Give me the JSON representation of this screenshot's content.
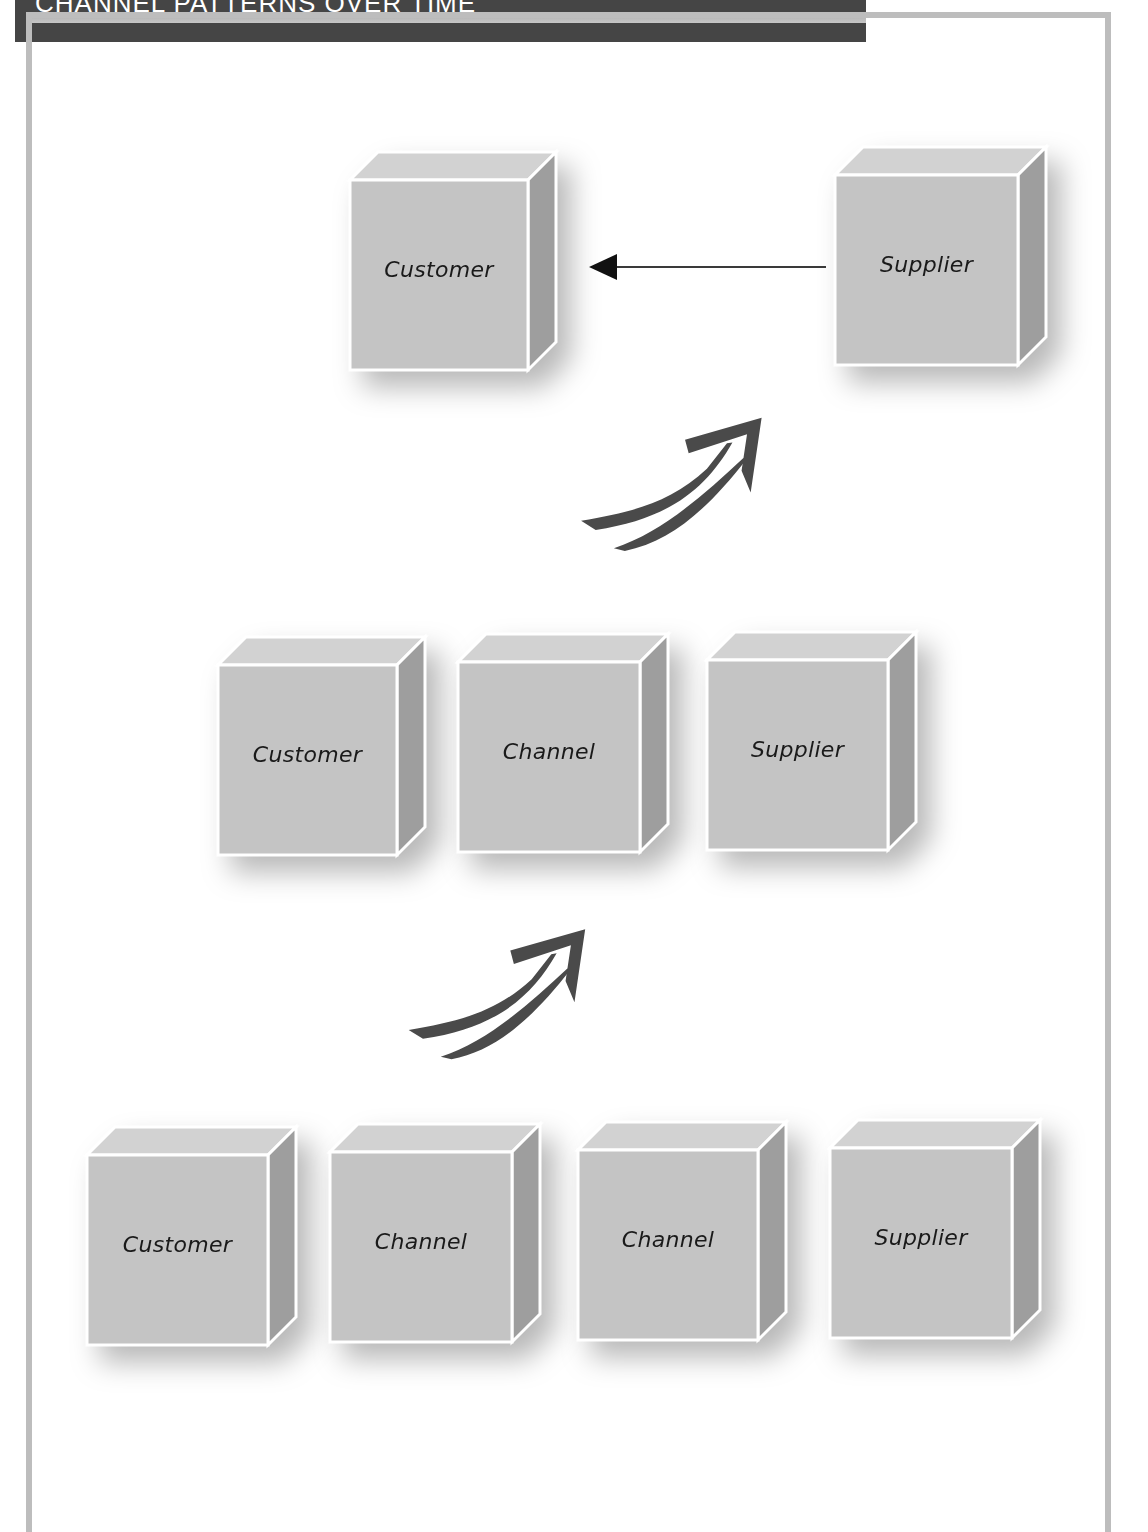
{
  "header": {
    "title": "CHANNEL PATTERNS OVER TIME"
  },
  "diagram": {
    "stages": [
      {
        "name": "direct",
        "nodes": [
          {
            "label": "Customer",
            "x": 350,
            "y": 180,
            "w": 178,
            "h": 190
          },
          {
            "label": "Supplier",
            "x": 835,
            "y": 175,
            "w": 183,
            "h": 190
          }
        ],
        "connector": {
          "type": "arrow-left",
          "from": "Supplier",
          "to": "Customer"
        }
      },
      {
        "name": "one-channel",
        "nodes": [
          {
            "label": "Customer",
            "x": 218,
            "y": 665,
            "w": 179,
            "h": 190
          },
          {
            "label": "Channel",
            "x": 458,
            "y": 662,
            "w": 182,
            "h": 190
          },
          {
            "label": "Supplier",
            "x": 707,
            "y": 660,
            "w": 181,
            "h": 190
          }
        ]
      },
      {
        "name": "two-channels",
        "nodes": [
          {
            "label": "Customer",
            "x": 87,
            "y": 1155,
            "w": 181,
            "h": 190
          },
          {
            "label": "Channel",
            "x": 330,
            "y": 1152,
            "w": 182,
            "h": 190
          },
          {
            "label": "Channel",
            "x": 578,
            "y": 1150,
            "w": 180,
            "h": 190
          },
          {
            "label": "Supplier",
            "x": 830,
            "y": 1148,
            "w": 182,
            "h": 190
          }
        ]
      }
    ],
    "transitions": [
      {
        "icon": "double-curved-arrow-up-right",
        "x": 570,
        "y": 405
      },
      {
        "icon": "double-curved-arrow-up-right",
        "x": 398,
        "y": 915
      }
    ],
    "colors": {
      "cube_face": "#c4c4c4",
      "cube_top": "#d2d2d2",
      "cube_side": "#9e9e9e",
      "cube_edge": "#ffffff",
      "arrow": "#4a4a4a",
      "frame": "#bdbdbd",
      "title_bg": "#454545"
    }
  }
}
